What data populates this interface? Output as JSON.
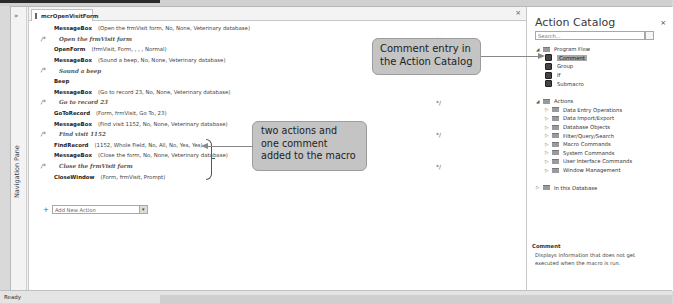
{
  "navigation_pane": {
    "toggle": "»",
    "label": "Navigation Pane"
  },
  "document_tab": {
    "title": "mcrOpenVisitForm",
    "close": "×"
  },
  "macro_rows": [
    {
      "type": "action",
      "name": "MessageBox",
      "args": "(Open the frmVisit form, No, None, Veterinary database)"
    },
    {
      "type": "comment",
      "start": "/*",
      "text": "Open the frmVisit form",
      "end": "*/"
    },
    {
      "type": "action",
      "name": "OpenForm",
      "args": "(frmVisit, Form, , , , Normal)"
    },
    {
      "type": "action",
      "name": "MessageBox",
      "args": "(Sound a beep, No, None, Veterinary database)"
    },
    {
      "type": "comment",
      "start": "/*",
      "text": "Sound a beep",
      "end": "*/"
    },
    {
      "type": "action",
      "name": "Beep",
      "args": ""
    },
    {
      "type": "action",
      "name": "MessageBox",
      "args": "(Go to record 23, No, None, Veterinary database)"
    },
    {
      "type": "comment",
      "start": "/*",
      "text": "Go to record 23",
      "end": "*/"
    },
    {
      "type": "action",
      "name": "GoToRecord",
      "args": "(Form, frmVisit, Go To, 23)"
    },
    {
      "type": "action",
      "name": "MessageBox",
      "args": "(Find visit 1152, No, None, Veterinary database)"
    },
    {
      "type": "comment",
      "start": "/*",
      "text": "Find visit 1152",
      "end": "*/"
    },
    {
      "type": "action",
      "name": "FindRecord",
      "args": "(1152, Whole Field, No, All, No, Yes, Yes)"
    },
    {
      "type": "action",
      "name": "MessageBox",
      "args": "(Close the form, No, None, Veterinary database)"
    },
    {
      "type": "comment",
      "start": "/*",
      "text": "Close the frmVisit form",
      "end": "*/"
    },
    {
      "type": "action",
      "name": "CloseWindow",
      "args": "(Form, frmVisit, Prompt)"
    }
  ],
  "add_new_action": {
    "icon": "+",
    "placeholder": "Add New Action",
    "dropdown": "▾"
  },
  "action_catalog": {
    "title": "Action Catalog",
    "close": "×",
    "search_placeholder": "Search...",
    "program_flow": {
      "label": "Program Flow",
      "items": [
        "Comment",
        "Group",
        "If",
        "Submacro"
      ],
      "selected": "Comment"
    },
    "actions": {
      "label": "Actions",
      "items": [
        "Data Entry Operations",
        "Data Import/Export",
        "Database Objects",
        "Filter/Query/Search",
        "Macro Commands",
        "System Commands",
        "User Interface Commands",
        "Window Management"
      ]
    },
    "in_this_database": "In this Database",
    "help": {
      "title": "Comment",
      "text": "Displays information that does not get executed when the macro is run."
    }
  },
  "status_bar": {
    "text": "Ready"
  },
  "callouts": {
    "catalog": "Comment entry in the Action Catalog",
    "added": "two actions and one comment added to the macro"
  }
}
